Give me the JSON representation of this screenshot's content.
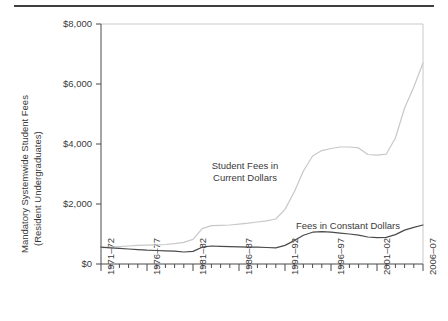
{
  "figure": {
    "y_axis_title_line1": "Mandatory Systemwide Student Fees",
    "y_axis_title_line2": "(Resident Undergraduates)"
  },
  "annotations": {
    "current_line1": "Student Fees in",
    "current_line2": "Current Dollars",
    "constant": "Fees in Constant Dollars"
  },
  "chart_data": {
    "type": "line",
    "title": "",
    "subtitle": "",
    "xlabel": "",
    "ylabel": "Mandatory Systemwide Student Fees (Resident Undergraduates)",
    "grid": false,
    "legend_position": "inline-annotations",
    "ylim": [
      0,
      8000
    ],
    "ytick_labels": [
      "$0",
      "$2,000",
      "$4,000",
      "$6,000",
      "$8,000"
    ],
    "ytick_values": [
      0,
      2000,
      4000,
      6000,
      8000
    ],
    "xtick_labels": [
      "1971–72",
      "1976–77",
      "1981–82",
      "1986–87",
      "1991–92",
      "1996–97",
      "2001–02",
      "2006–07"
    ],
    "xtick_values": [
      1971,
      1976,
      1981,
      1986,
      1991,
      1996,
      2001,
      2006
    ],
    "minor_ticks": "annual",
    "xlim": [
      1971,
      2006
    ],
    "x": [
      1971,
      1972,
      1973,
      1974,
      1975,
      1976,
      1977,
      1978,
      1979,
      1980,
      1981,
      1982,
      1983,
      1984,
      1985,
      1986,
      1987,
      1988,
      1989,
      1990,
      1991,
      1992,
      1993,
      1994,
      1995,
      1996,
      1997,
      1998,
      1999,
      2000,
      2001,
      2002,
      2003,
      2004,
      2005,
      2006
    ],
    "series": [
      {
        "name": "Student Fees in Current Dollars",
        "color": "#c8c8c8",
        "values": [
          540,
          560,
          580,
          600,
          620,
          630,
          640,
          650,
          680,
          720,
          820,
          1180,
          1280,
          1290,
          1300,
          1330,
          1360,
          1400,
          1440,
          1500,
          1820,
          2400,
          3100,
          3600,
          3780,
          3850,
          3900,
          3900,
          3870,
          3650,
          3630,
          3660,
          4200,
          5200,
          5900,
          6700
        ]
      },
      {
        "name": "Fees in Constant Dollars",
        "color": "#4a4a4a",
        "values": [
          560,
          540,
          520,
          500,
          480,
          460,
          450,
          440,
          430,
          400,
          420,
          560,
          600,
          590,
          580,
          570,
          560,
          560,
          550,
          540,
          620,
          780,
          960,
          1060,
          1080,
          1060,
          1030,
          1000,
          960,
          900,
          880,
          890,
          980,
          1130,
          1220,
          1300
        ]
      }
    ]
  }
}
